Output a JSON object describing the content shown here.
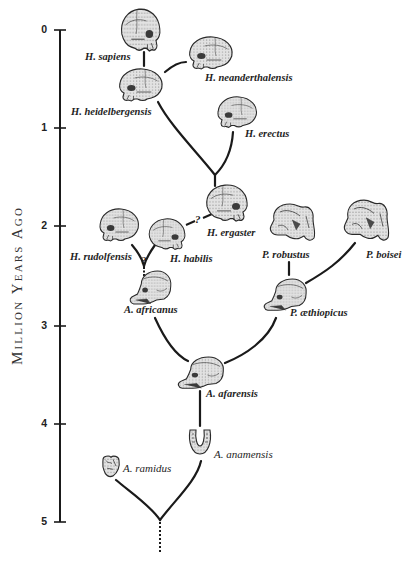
{
  "axis": {
    "title": "Million Years Ago",
    "ticks": [
      {
        "label": "0",
        "y": 30
      },
      {
        "label": "1",
        "y": 128
      },
      {
        "label": "2",
        "y": 226
      },
      {
        "label": "3",
        "y": 326
      },
      {
        "label": "4",
        "y": 424
      },
      {
        "label": "5",
        "y": 522
      }
    ]
  },
  "species": [
    {
      "id": "h-sapiens",
      "label": "H. sapiens"
    },
    {
      "id": "h-neanderthalensis",
      "label": "H. neanderthalensis"
    },
    {
      "id": "h-heidelbergensis",
      "label": "H. heidelbergensis"
    },
    {
      "id": "h-erectus",
      "label": "H. erectus"
    },
    {
      "id": "h-ergaster",
      "label": "H. ergaster"
    },
    {
      "id": "h-rudolfensis",
      "label": "H. rudolfensis"
    },
    {
      "id": "h-habilis",
      "label": "H. habilis"
    },
    {
      "id": "a-africanus",
      "label": "A. africanus"
    },
    {
      "id": "p-robustus",
      "label": "P. robustus"
    },
    {
      "id": "p-boisei",
      "label": "P. boisei"
    },
    {
      "id": "p-aethiopicus",
      "label": "P. æthiopicus"
    },
    {
      "id": "a-afarensis",
      "label": "A. afarensis"
    },
    {
      "id": "a-anamensis",
      "label": "A. anamensis"
    },
    {
      "id": "a-ramidus",
      "label": "A. ramidus"
    }
  ],
  "uncertain_links": [
    {
      "from": "H. habilis",
      "to": "H. ergaster",
      "marker": "?"
    },
    {
      "from": "A. africanus",
      "to": "H. rudolfensis / H. habilis",
      "marker": "?"
    }
  ],
  "colors": {
    "ink": "#1a1a1a",
    "skull_fill": "#d9d9d9",
    "skull_shade": "#6e6e6e",
    "background": "#ffffff"
  }
}
